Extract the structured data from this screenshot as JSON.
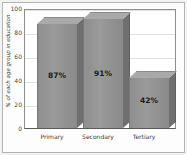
{
  "chart_data": {
    "type": "bar",
    "title": "",
    "subtitle": "",
    "xlabel": "",
    "ylabel": "% of each age group in education",
    "categories": [
      "Primary",
      "Secondary",
      "Tertiary"
    ],
    "values": [
      87,
      91,
      42
    ],
    "data_labels": [
      "87%",
      "91%",
      "42%"
    ],
    "ylim": [
      0,
      100
    ],
    "yticks": [
      0,
      20,
      40,
      60,
      80,
      100
    ],
    "ytick_labels": [
      "0",
      "20",
      "40",
      "60",
      "80",
      "100"
    ],
    "grid": true,
    "grid_axis": "y",
    "legend": false,
    "legend_position": "none",
    "style": "3d-bar",
    "colors": {
      "bar_face": "#8f8f8f",
      "bar_top": "#a9a9a9",
      "bar_side": "#6f6f6f",
      "plot_background": "#ffffff",
      "figure_background": "#fdfdfd",
      "grid": "#e2e2e2",
      "axis": "#8e8e8e",
      "text": "#3c3c3c",
      "label_text": "#1a1a1a"
    }
  }
}
